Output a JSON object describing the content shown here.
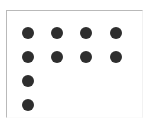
{
  "figure": {
    "width": 149,
    "height": 121,
    "background_color": "#ffffff",
    "frame": {
      "name": "plot-frame",
      "left": 6,
      "top": 10,
      "width": 137,
      "height": 108,
      "border_color": "#b9b9b9"
    }
  },
  "chart_data": {
    "type": "scatter",
    "title": "",
    "subtitle": "",
    "xlabel": "",
    "ylabel": "",
    "grid": false,
    "legend": null,
    "annotations": [],
    "marker": {
      "shape": "circle",
      "color": "#2e2e2e",
      "diameter_px": 12
    },
    "xlim": [
      0,
      5
    ],
    "ylim": [
      0,
      5
    ],
    "x_tick_labels": [],
    "y_tick_labels": [],
    "columns": 4,
    "rows": 4,
    "counts_per_row": [
      4,
      4,
      1,
      1
    ],
    "column_centers_px": [
      28,
      57,
      86,
      116
    ],
    "row_centers_px": [
      33,
      57,
      81,
      105
    ],
    "points": [
      {
        "row": 1,
        "col": 1,
        "cx": 28,
        "cy": 33
      },
      {
        "row": 1,
        "col": 2,
        "cx": 57,
        "cy": 33
      },
      {
        "row": 1,
        "col": 3,
        "cx": 86,
        "cy": 33
      },
      {
        "row": 1,
        "col": 4,
        "cx": 116,
        "cy": 33
      },
      {
        "row": 2,
        "col": 1,
        "cx": 28,
        "cy": 57
      },
      {
        "row": 2,
        "col": 2,
        "cx": 57,
        "cy": 57
      },
      {
        "row": 2,
        "col": 3,
        "cx": 86,
        "cy": 57
      },
      {
        "row": 2,
        "col": 4,
        "cx": 116,
        "cy": 57
      },
      {
        "row": 3,
        "col": 1,
        "cx": 28,
        "cy": 81
      },
      {
        "row": 4,
        "col": 1,
        "cx": 28,
        "cy": 105
      }
    ]
  }
}
